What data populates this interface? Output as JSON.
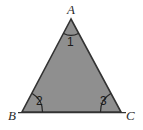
{
  "figure": {
    "kind": "geometry-diagram",
    "shape": "triangle",
    "canvas": {
      "width": 143,
      "height": 130
    },
    "colors": {
      "background": "#ffffff",
      "triangle_fill": "#8f8f8f",
      "triangle_stroke": "#333333",
      "arc_stroke": "#262626",
      "label_text": "#2b2b2b",
      "number_text": "#1a1a1a"
    },
    "vertices": [
      {
        "id": "A",
        "label": "A",
        "x": 71,
        "y": 19
      },
      {
        "id": "B",
        "label": "B",
        "x": 22,
        "y": 112
      },
      {
        "id": "C",
        "label": "C",
        "x": 121,
        "y": 112
      }
    ],
    "angle_marks": [
      {
        "id": "angle-1",
        "label": "1",
        "at_vertex": "A"
      },
      {
        "id": "angle-2",
        "label": "2",
        "at_vertex": "B"
      },
      {
        "id": "angle-3",
        "label": "3",
        "at_vertex": "C"
      }
    ],
    "labels": {
      "vertex_a": "A",
      "vertex_b": "B",
      "vertex_c": "C",
      "angle_one": "1",
      "angle_two": "2",
      "angle_three": "3"
    }
  }
}
